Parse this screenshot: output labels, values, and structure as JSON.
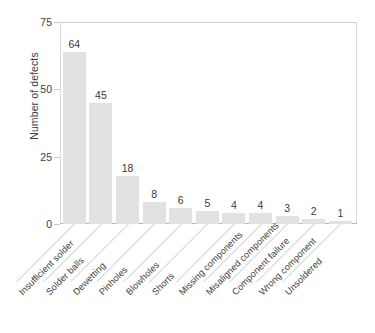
{
  "chart_data": {
    "type": "bar",
    "title": "",
    "subtitle": "",
    "xlabel": "",
    "ylabel": "Number of defects",
    "ylim": [
      0,
      75
    ],
    "yticks": [
      0,
      25,
      50,
      75
    ],
    "grid": false,
    "legend": false,
    "orientation": "vertical",
    "bar_color": "#e2e2e2",
    "data_labels_shown": true,
    "categories": [
      "Insufficient solder",
      "Solder balls",
      "Dewetting",
      "Pinholes",
      "Blowholes",
      "Shorts",
      "Missing components",
      "Misaligned components",
      "Component failure",
      "Wrong component",
      "Unsoldered"
    ],
    "values": [
      64,
      45,
      18,
      8,
      6,
      5,
      4,
      4,
      3,
      2,
      1
    ],
    "total": 160
  },
  "axes": {
    "y_title": "Number of defects",
    "y_tick_labels": [
      "75",
      "50",
      "25",
      "0"
    ],
    "frame_color": "#d9d9d9",
    "tick_color": "#c8c8c8"
  }
}
